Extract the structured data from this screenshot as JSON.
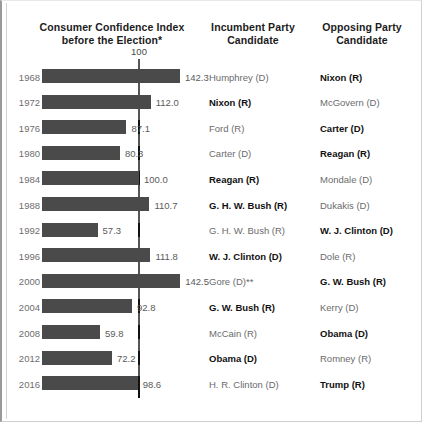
{
  "headers": {
    "chart": "Consumer Confidence Index\nbefore the Election*",
    "chart_line1": "Consumer Confidence Index",
    "chart_line2": "before the Election*",
    "incumbent": "Incumbent Party\nCandidate",
    "incumbent_line1": "Incumbent Party",
    "incumbent_line2": "Candidate",
    "opposing": "Opposing Party\nCandidate",
    "opposing_line1": "Opposing Party",
    "opposing_line2": "Candidate"
  },
  "reference_label": "100",
  "colors": {
    "bar": "#4a4a4a",
    "reference_line": "#111111",
    "year_text": "#6e6e6e",
    "value_text": "#5a5a5a",
    "candidate_text": "#6b6b6b",
    "winner_text": "#111111"
  },
  "chart_data": {
    "type": "bar",
    "title": "Consumer Confidence Index before the Election*",
    "xlabel": "",
    "ylabel": "",
    "orientation": "horizontal",
    "reference_line": 100,
    "xlim": [
      0,
      150
    ],
    "grid": false,
    "legend": null,
    "categories": [
      "1968",
      "1972",
      "1976",
      "1980",
      "1984",
      "1988",
      "1992",
      "1996",
      "2000",
      "2004",
      "2008",
      "2012",
      "2016"
    ],
    "values": [
      142.3,
      112.0,
      87.1,
      80.3,
      100.0,
      110.7,
      57.3,
      111.8,
      142.5,
      92.8,
      59.8,
      72.2,
      98.6
    ],
    "value_labels": [
      "142.3",
      "112.0",
      "87.1",
      "80.3",
      "100.0",
      "110.7",
      "57.3",
      "111.8",
      "142.5",
      "92.8",
      "59.8",
      "72.2",
      "98.6"
    ]
  },
  "rows": [
    {
      "year": "1968",
      "value": 142.3,
      "value_label": "142.3",
      "incumbent": "Humphrey (D)",
      "incumbent_won": false,
      "opposing": "Nixon (R)",
      "opposing_won": true
    },
    {
      "year": "1972",
      "value": 112.0,
      "value_label": "112.0",
      "incumbent": "Nixon (R)",
      "incumbent_won": true,
      "opposing": "McGovern (D)",
      "opposing_won": false
    },
    {
      "year": "1976",
      "value": 87.1,
      "value_label": "87.1",
      "incumbent": "Ford (R)",
      "incumbent_won": false,
      "opposing": "Carter (D)",
      "opposing_won": true
    },
    {
      "year": "1980",
      "value": 80.3,
      "value_label": "80.3",
      "incumbent": "Carter (D)",
      "incumbent_won": false,
      "opposing": "Reagan (R)",
      "opposing_won": true
    },
    {
      "year": "1984",
      "value": 100.0,
      "value_label": "100.0",
      "incumbent": "Reagan (R)",
      "incumbent_won": true,
      "opposing": "Mondale (D)",
      "opposing_won": false
    },
    {
      "year": "1988",
      "value": 110.7,
      "value_label": "110.7",
      "incumbent": "G. H. W. Bush (R)",
      "incumbent_won": true,
      "opposing": "Dukakis (D)",
      "opposing_won": false
    },
    {
      "year": "1992",
      "value": 57.3,
      "value_label": "57.3",
      "incumbent": "G. H. W. Bush (R)",
      "incumbent_won": false,
      "opposing": "W. J. Clinton (D)",
      "opposing_won": true
    },
    {
      "year": "1996",
      "value": 111.8,
      "value_label": "111.8",
      "incumbent": "W. J. Clinton (D)",
      "incumbent_won": true,
      "opposing": "Dole (R)",
      "opposing_won": false
    },
    {
      "year": "2000",
      "value": 142.5,
      "value_label": "142.5",
      "incumbent": "Gore (D)**",
      "incumbent_won": false,
      "opposing": "G. W. Bush (R)",
      "opposing_won": true
    },
    {
      "year": "2004",
      "value": 92.8,
      "value_label": "92.8",
      "incumbent": "G. W. Bush (R)",
      "incumbent_won": true,
      "opposing": "Kerry (D)",
      "opposing_won": false
    },
    {
      "year": "2008",
      "value": 59.8,
      "value_label": "59.8",
      "incumbent": "McCain (R)",
      "incumbent_won": false,
      "opposing": "Obama (D)",
      "opposing_won": true
    },
    {
      "year": "2012",
      "value": 72.2,
      "value_label": "72.2",
      "incumbent": "Obama (D)",
      "incumbent_won": true,
      "opposing": "Romney (R)",
      "opposing_won": false
    },
    {
      "year": "2016",
      "value": 98.6,
      "value_label": "98.6",
      "incumbent": "H. R. Clinton (D)",
      "incumbent_won": false,
      "opposing": "Trump (R)",
      "opposing_won": true
    }
  ]
}
